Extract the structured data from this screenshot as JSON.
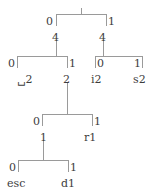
{
  "figure": {
    "type": "binary-decision-tree",
    "line_color": "#9a9a9a",
    "text_color": "#3d3d3d",
    "background": "#ffffff"
  },
  "tree": {
    "root": {
      "label": "",
      "x": 81,
      "y": 8
    },
    "levels": [
      {
        "name": "level-1",
        "bracket": {
          "x1": 56,
          "x2": 106,
          "y": 14,
          "stem_x": 81,
          "stem_y": 8
        },
        "edges": [
          {
            "name": "edge-root-left",
            "label": "0",
            "x": 48,
            "y": 18
          },
          {
            "name": "edge-root-right",
            "label": "1",
            "x": 109,
            "y": 18
          }
        ],
        "nodes": [
          {
            "name": "node-left-4",
            "label": "4",
            "x": 53,
            "y": 34
          },
          {
            "name": "node-right-4",
            "label": "4",
            "x": 103,
            "y": 34
          }
        ]
      },
      {
        "name": "level-2-left",
        "bracket": {
          "x1": 17,
          "x2": 67,
          "y": 56,
          "stem_x": 56,
          "stem_y": 48
        },
        "edges": [
          {
            "name": "edge-l-0",
            "label": "0",
            "x": 9,
            "y": 60
          },
          {
            "name": "edge-l-1",
            "label": "1",
            "x": 70,
            "y": 60
          }
        ],
        "leaves": [
          {
            "name": "leaf-space-2",
            "label": "␣2",
            "x": 19,
            "y": 76
          },
          {
            "name": "node-2",
            "label": "2",
            "x": 63,
            "y": 76
          }
        ]
      },
      {
        "name": "level-2-right",
        "bracket": {
          "x1": 95,
          "x2": 142,
          "y": 56,
          "stem_x": 103,
          "stem_y": 48
        },
        "edges": [
          {
            "name": "edge-r-0",
            "label": "0",
            "x": 96,
            "y": 60
          },
          {
            "name": "edge-r-1",
            "label": "1",
            "x": 135,
            "y": 60
          }
        ],
        "leaves": [
          {
            "name": "leaf-i2",
            "label": "i2",
            "x": 92,
            "y": 76
          },
          {
            "name": "leaf-s2",
            "label": "s2",
            "x": 134,
            "y": 76
          }
        ]
      },
      {
        "name": "level-3",
        "bracket": {
          "x1": 42,
          "x2": 92,
          "y": 114,
          "stem_x": 67,
          "stem_y": 106
        },
        "edges": [
          {
            "name": "edge-3-0",
            "label": "0",
            "x": 34,
            "y": 118
          },
          {
            "name": "edge-3-1",
            "label": "1",
            "x": 95,
            "y": 118
          }
        ],
        "leaves": [
          {
            "name": "node-1",
            "label": "1",
            "x": 42,
            "y": 134
          },
          {
            "name": "leaf-r1",
            "label": "r1",
            "x": 85,
            "y": 134
          }
        ]
      },
      {
        "name": "level-4",
        "bracket": {
          "x1": 18,
          "x2": 68,
          "y": 160,
          "stem_x": 43,
          "stem_y": 152
        },
        "edges": [
          {
            "name": "edge-4-0",
            "label": "0",
            "x": 10,
            "y": 164
          },
          {
            "name": "edge-4-1",
            "label": "1",
            "x": 71,
            "y": 164
          }
        ],
        "leaves": [
          {
            "name": "leaf-esc",
            "label": "esc",
            "x": 8,
            "y": 180
          },
          {
            "name": "leaf-d1",
            "label": "d1",
            "x": 62,
            "y": 180
          }
        ]
      }
    ]
  }
}
